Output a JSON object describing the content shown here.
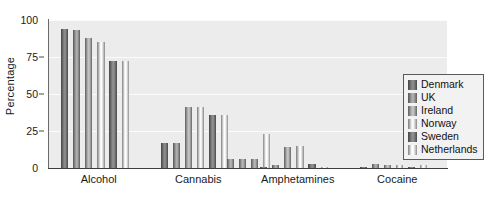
{
  "chart_data": {
    "type": "bar",
    "title": "",
    "xlabel": "",
    "ylabel": "Percentage",
    "ylim": [
      0,
      100
    ],
    "yticks": [
      0,
      25,
      50,
      75,
      100
    ],
    "ytick_labels": [
      "0",
      "25",
      "50",
      "75",
      "100"
    ],
    "grid": true,
    "grid_axis": "y",
    "legend_position": "right",
    "categories": [
      "Alcohol",
      "Cannabis",
      "Amphetamines",
      "Cocaine"
    ],
    "series": [
      {
        "name": "Denmark",
        "color": "#6e6e6e",
        "values": [
          94,
          17,
          1,
          1
        ]
      },
      {
        "name": "UK",
        "color": "#8a8a8a",
        "values": [
          93,
          17,
          2,
          3
        ]
      },
      {
        "name": "Ireland",
        "color": "#9a9a9a",
        "values": [
          88,
          41,
          14,
          2
        ]
      },
      {
        "name": "Norway",
        "color": "#c8c8c8",
        "values": [
          85,
          41,
          15,
          2
        ]
      },
      {
        "name": "Sweden",
        "color": "#707070",
        "values": [
          72,
          36,
          3,
          1
        ]
      },
      {
        "name": "Netherlands",
        "color": "#d2d2d2",
        "values": [
          72,
          36,
          1,
          2
        ]
      }
    ],
    "extra_bars": {
      "note": "Cannabis group shows additional low bars around 6 and a taller Netherlands bar near 23",
      "cannabis_low": [
        6,
        6,
        6
      ],
      "cannabis_netherlands": 23
    },
    "plot_background": "#ececec",
    "gridline_color": "#fbfbfb",
    "axis_color": "#3d3d3d"
  },
  "legend": {
    "items": [
      {
        "label": "Denmark"
      },
      {
        "label": "UK"
      },
      {
        "label": "Ireland"
      },
      {
        "label": "Norway"
      },
      {
        "label": "Sweden"
      },
      {
        "label": "Netherlands"
      }
    ]
  }
}
